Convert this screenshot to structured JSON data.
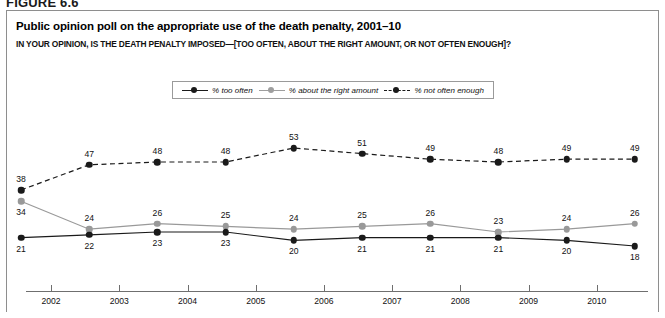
{
  "figure": {
    "number_label": "FIGURE 6.6"
  },
  "title": "Public opinion poll on the appropriate use of the death penalty, 2001–10",
  "subtitle": "IN YOUR OPINION, IS THE DEATH PENALTY IMPOSED—[TOO OFTEN, ABOUT THE RIGHT AMOUNT, OR NOT OFTEN ENOUGH]?",
  "source_note": "",
  "legend": {
    "items": [
      {
        "label": "% too often",
        "color": "#1a1a1a",
        "style": "solid"
      },
      {
        "label": "% about the right amount",
        "color": "#999999",
        "style": "solid"
      },
      {
        "label": "% not often enough",
        "color": "#1a1a1a",
        "style": "dashed"
      }
    ]
  },
  "chart_data": {
    "type": "line",
    "title": "Public opinion poll on the appropriate use of the death penalty, 2001–10",
    "subtitle": "IN YOUR OPINION, IS THE DEATH PENALTY IMPOSED—[TOO OFTEN, ABOUT THE RIGHT AMOUNT, OR NOT OFTEN ENOUGH]?",
    "xlabel": "",
    "ylabel": "",
    "x": [
      2001,
      2002,
      2003,
      2004,
      2005,
      2006,
      2007,
      2008,
      2009,
      2010
    ],
    "categories": [
      "2001",
      "2002",
      "2003",
      "2004",
      "2005",
      "2006",
      "2007",
      "2008",
      "2009",
      "2010"
    ],
    "axis_tick_labels": [
      "2002",
      "2003",
      "2004",
      "2005",
      "2006",
      "2007",
      "2008",
      "2009",
      "2010"
    ],
    "ylim": [
      0,
      60
    ],
    "grid": false,
    "legend_position": "top-center",
    "series": [
      {
        "name": "% not often enough",
        "color": "#1a1a1a",
        "style": "dashed",
        "values": [
          38,
          47,
          48,
          48,
          53,
          51,
          49,
          48,
          49,
          49
        ]
      },
      {
        "name": "% about the right amount",
        "color": "#999999",
        "style": "solid",
        "values": [
          34,
          24,
          26,
          25,
          24,
          25,
          26,
          23,
          24,
          26
        ]
      },
      {
        "name": "% too often",
        "color": "#1a1a1a",
        "style": "solid",
        "values": [
          21,
          22,
          23,
          23,
          20,
          21,
          21,
          21,
          20,
          18
        ]
      }
    ]
  }
}
